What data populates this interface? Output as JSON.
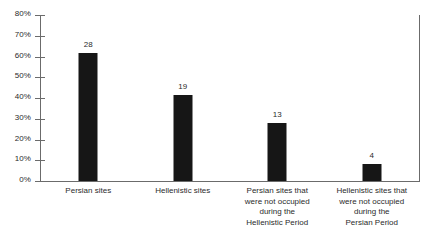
{
  "chart_data": {
    "type": "bar",
    "title": "",
    "subtitle": "",
    "xlabel": "",
    "ylabel": "",
    "categories": [
      "Persian sites",
      "Hellenistic sites",
      "Persian sites that were not occupied during the Hellenistic Period",
      "Hellenistic sites that were not occupied during the Persian Period"
    ],
    "category_lines": [
      [
        "Persian sites"
      ],
      [
        "Hellenistic sites"
      ],
      [
        "Persian sites that",
        "were not occupied",
        "during the",
        "Hellenistic Period"
      ],
      [
        "Hellenistic sites that",
        "were not occupied",
        "during the",
        "Persian Period"
      ]
    ],
    "values": [
      61.5,
      41.5,
      28.0,
      8.0
    ],
    "data_labels": [
      "28",
      "19",
      "13",
      "4"
    ],
    "counts": [
      28,
      19,
      13,
      4
    ],
    "ylim": [
      0,
      80
    ],
    "ytick_values": [
      0,
      10,
      20,
      30,
      40,
      50,
      60,
      70,
      80
    ],
    "ytick_labels": [
      "0%",
      "10%",
      "20%",
      "30%",
      "40%",
      "50%",
      "60%",
      "70%",
      "80%"
    ],
    "grid": false,
    "legend": false,
    "legend_position": "none",
    "bar_color": "#161616",
    "axis_color": "#6b6b6b",
    "text_color": "#2b2b2b",
    "background_color": "#ffffff"
  }
}
